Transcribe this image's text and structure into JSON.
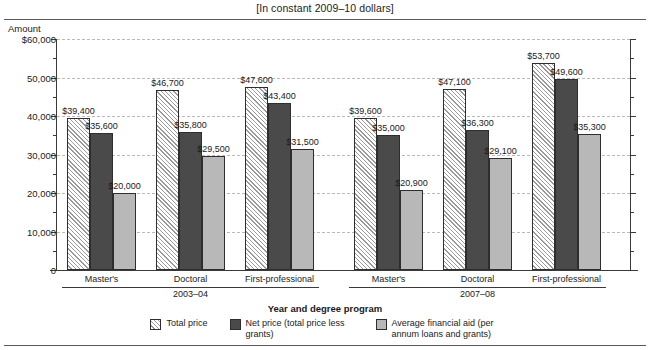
{
  "chart_data": {
    "type": "bar",
    "title": "",
    "subtitle": "[In constant 2009–10 dollars]",
    "xlabel": "Year and degree program",
    "ylabel": "Amount",
    "ylim": [
      0,
      60000
    ],
    "ytick_labels": [
      "$60,000",
      "50,000",
      "40,000",
      "30,000",
      "20,000",
      "10,000",
      "0"
    ],
    "ytick_values": [
      60000,
      50000,
      40000,
      30000,
      20000,
      10000,
      0
    ],
    "minor_tick_values": [
      55000,
      45000,
      35000,
      25000,
      15000,
      5000
    ],
    "grid": true,
    "legend_position": "bottom",
    "groups": [
      {
        "year": "2003–04",
        "categories": [
          "Master's",
          "Doctoral",
          "First-professional"
        ]
      },
      {
        "year": "2007–08",
        "categories": [
          "Master's",
          "Doctoral",
          "First-professional"
        ]
      }
    ],
    "categories": [
      "2003-04 Master's",
      "2003-04 Doctoral",
      "2003-04 First-professional",
      "2007-08 Master's",
      "2007-08 Doctoral",
      "2007-08 First-professional"
    ],
    "series": [
      {
        "name": "Total price",
        "key": "total",
        "color": "#fbfbfb",
        "pattern": "diagonal-hatch",
        "values": [
          39400,
          46700,
          47600,
          39600,
          47100,
          53700
        ],
        "labels": [
          "$39,400",
          "$46,700",
          "$47,600",
          "$39,600",
          "$47,100",
          "$53,700"
        ]
      },
      {
        "name": "Net price (total price less grants)",
        "key": "net",
        "color": "#4a4a4a",
        "pattern": "solid",
        "values": [
          35600,
          35800,
          43400,
          35000,
          36300,
          49600
        ],
        "labels": [
          "$35,600",
          "$35,800",
          "$43,400",
          "$35,000",
          "$36,300",
          "$49,600"
        ]
      },
      {
        "name": "Average financial aid (per annum loans and grants)",
        "key": "aid",
        "color": "#b8b8b8",
        "pattern": "solid",
        "values": [
          20000,
          29500,
          31500,
          20900,
          29100,
          35300
        ],
        "labels": [
          "$20,000",
          "$29,500",
          "$31,500",
          "$20,900",
          "$29,100",
          "$35,300"
        ]
      }
    ]
  },
  "legend": {
    "items": [
      {
        "label": "Total price",
        "key": "total"
      },
      {
        "label": "Net price (total price less grants)",
        "key": "net"
      },
      {
        "label": "Average financial aid (per annum loans and grants)",
        "key": "aid"
      }
    ]
  }
}
